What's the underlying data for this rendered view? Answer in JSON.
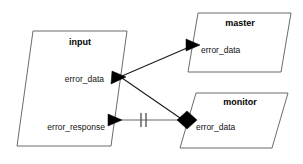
{
  "diagram": {
    "type": "dataflow-block-diagram",
    "background_color": "#ffffff",
    "outline_color": "#6b6b6b",
    "text_color": "#000000",
    "blocks": [
      {
        "id": "input",
        "title": "input",
        "shape": "parallelogram",
        "ports": [
          {
            "label": "error_data",
            "marker": "filled-arrowhead",
            "direction": "in"
          },
          {
            "label": "error_response",
            "marker": "filled-arrowhead",
            "direction": "in"
          }
        ]
      },
      {
        "id": "master",
        "title": "master",
        "shape": "parallelogram",
        "ports": [
          {
            "label": "error_data",
            "marker": "filled-arrowhead",
            "direction": "in"
          }
        ]
      },
      {
        "id": "monitor",
        "title": "monitor",
        "shape": "parallelogram",
        "ports": [
          {
            "label": "error_data",
            "marker": "filled-diamond",
            "direction": "inout"
          }
        ]
      }
    ],
    "connections": [
      {
        "from": "input.error_data",
        "to": "master.error_data",
        "style": "solid-diagonal",
        "marker_end": "arrowhead"
      },
      {
        "from": "input.error_data",
        "to": "monitor.error_data",
        "style": "solid-diagonal",
        "marker_end": "diamond"
      },
      {
        "from": "monitor.error_data",
        "to": "input.error_response",
        "style": "solid-horizontal",
        "marker_end": "arrowhead",
        "decoration": "double-bar"
      }
    ],
    "decorations": [
      {
        "name": "double-bar",
        "glyph": "||",
        "count": 2
      }
    ]
  }
}
